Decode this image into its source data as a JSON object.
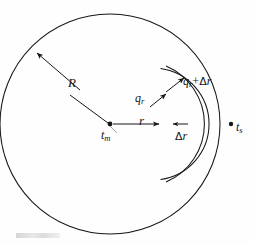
{
  "figure": {
    "kind": "hand-drawn-technical-diagram",
    "background_color": "#fefefe",
    "ink_color": "#161616"
  },
  "labels": {
    "outer_radius": "R",
    "center_temperature": {
      "base": "t",
      "subscript": "m"
    },
    "shell_radius": "r",
    "heat_flux_in": {
      "base": "q",
      "subscript": "r"
    },
    "heat_flux_out": {
      "base": "q",
      "subscript": "r",
      "operator": "+",
      "increment_symbol": "Δ",
      "increment_variable": "r"
    },
    "shell_thickness": {
      "increment_symbol": "Δ",
      "increment_variable": "r"
    },
    "surface_temperature": {
      "base": "t",
      "subscript": "s"
    }
  },
  "geometry": {
    "sphere_center": {
      "x": 110,
      "y": 124
    },
    "sphere_radius": 110,
    "shell_inner_radius": 56,
    "shell_outer_radius": 63,
    "surface_point": {
      "x": 220,
      "y": 124
    }
  }
}
